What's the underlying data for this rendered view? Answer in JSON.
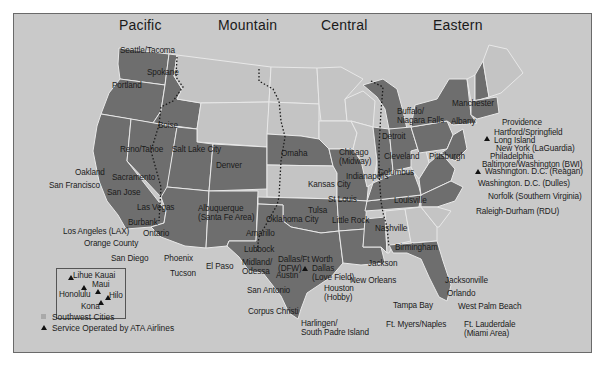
{
  "map": {
    "time_zones": [
      "Pacific",
      "Mountain",
      "Central",
      "Eastern"
    ],
    "colors": {
      "background": "#c9c9c9",
      "served_state": "#6e6e6e",
      "unserved_state": "#c4c4c4",
      "border": "#e8e8e8",
      "frame": "#6a6a6a"
    },
    "cities": {
      "seattle": "Seattle/Tacoma",
      "spokane": "Spokane",
      "portland": "Portland",
      "boise": "Boise",
      "reno": "Reno/Tahoe",
      "slc": "Salt Lake City",
      "oakland": "Oakland",
      "sacramento": "Sacramento",
      "sf": "San Francisco",
      "sanjose": "San Jose",
      "lasvegas": "Las Vegas",
      "burbank": "Burbank",
      "lax": "Los Angeles (LAX)",
      "ontario": "Ontario",
      "orange": "Orange County",
      "sandiego": "San Diego",
      "phoenix": "Phoenix",
      "tucson": "Tucson",
      "denver": "Denver",
      "albuquerque": "Albuquerque\n(Santa Fe Area)",
      "albuquerque_1": "Albuquerque",
      "albuquerque_2": "(Santa Fe Area)",
      "amarillo": "Amarillo",
      "lubbock": "Lubbock",
      "elpaso": "El Paso",
      "midland_1": "Midland/",
      "midland_2": "Odessa",
      "austin": "Austin",
      "sanantonio": "San Antonio",
      "corpus": "Corpus Christi",
      "harlingen_1": "Harlingen/",
      "harlingen_2": "South Padre Island",
      "dfw_1": "Dallas/Ft Worth",
      "dfw_2": "(DFW)",
      "lovefield_1": "Dallas",
      "lovefield_2": "(Love Field)",
      "houston_1": "Houston",
      "houston_2": "(Hobby)",
      "omaha": "Omaha",
      "kansascity": "Kansas City",
      "tulsa": "Tulsa",
      "okc": "Oklahoma City",
      "littlerock": "Little Rock",
      "stlouis": "St Louis",
      "neworleans": "New Orleans",
      "jackson": "Jackson",
      "birmingham": "Birmingham",
      "nashville": "Nashville",
      "louisville": "Louisville",
      "indianapolis": "Indianapolis",
      "chicago_1": "Chicago",
      "chicago_2": "(Midway)",
      "detroit": "Detroit",
      "cleveland": "Cleveland",
      "columbus": "Columbus",
      "buffalo_1": "Buffalo/",
      "buffalo_2": "Niagara Falls",
      "pittsburgh": "Pittsburgh",
      "albany": "Albany",
      "manchester": "Manchester",
      "providence": "Providence",
      "hartford": "Hartford/Springfield",
      "longisland": "Long Island",
      "laguardia": "New York (LaGuardia)",
      "philadelphia": "Philadelphia",
      "bwi": "Baltimore/Washington (BWI)",
      "reagan": "Washington. D.C. (Reagan)",
      "dulles": "Washington. D.C. (Dulles)",
      "norfolk": "Norfolk (Southern Virginia)",
      "raleigh": "Raleigh-Durham (RDU)",
      "jacksonville": "Jacksonville",
      "orlando": "Orlando",
      "tampa": "Tampa Bay",
      "wpb": "West Palm Beach",
      "ftmyers": "Ft. Myers/Naples",
      "ftl_1": "Ft. Lauderdale",
      "ftl_2": "(Miami Area)"
    },
    "hawaii": {
      "lihue": "Lihue Kauai",
      "honolulu": "Honolulu",
      "maui": "Maui",
      "hilo": "Hilo",
      "kona": "Kona"
    },
    "legend": {
      "southwest_cities": "Southwest Cities",
      "ata_service": "Service Operated by ATA Airlines"
    }
  }
}
